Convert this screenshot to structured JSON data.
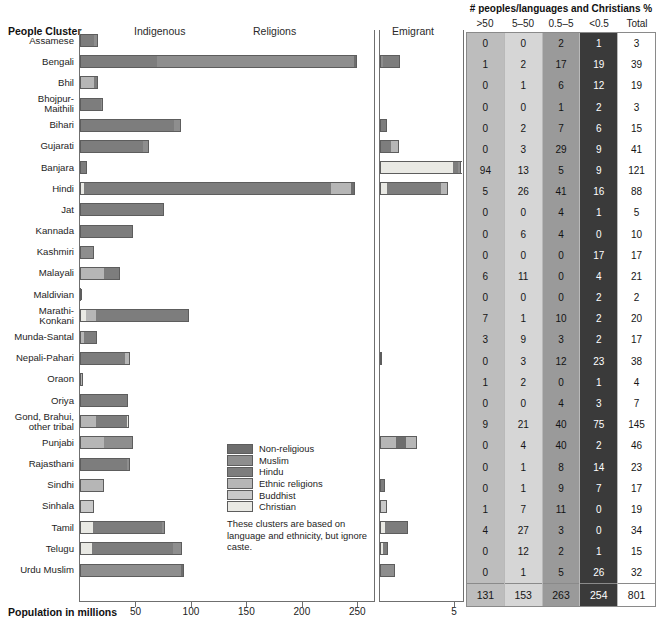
{
  "headers": {
    "people_cluster": "People Cluster",
    "indigenous": "Indigenous",
    "religions": "Religions",
    "emigrant": "Emigrant",
    "table_title": "# peoples/languages and Christians %",
    "axis_title": "Population in millions"
  },
  "table_columns": [
    ">50",
    "5–50",
    "0.5–5",
    "<0.5",
    "Total"
  ],
  "axis": {
    "main_ticks": [
      "50",
      "100",
      "150",
      "200",
      "250"
    ],
    "main_tick_values": [
      50,
      100,
      150,
      200,
      250
    ],
    "main_max": 265,
    "emigrant_ticks": [
      "5"
    ],
    "emigrant_max": 5.6
  },
  "legend": {
    "items": [
      {
        "label": "Non-religious",
        "color": "#6e6e6e"
      },
      {
        "label": "Muslim",
        "color": "#8e8e8e"
      },
      {
        "label": "Hindu",
        "color": "#7d7d7d"
      },
      {
        "label": "Ethnic religions",
        "color": "#b6b6b6"
      },
      {
        "label": "Buddhist",
        "color": "#c9c9c9"
      },
      {
        "label": "Christian",
        "color": "#e9e9e4"
      }
    ],
    "note": "These clusters are based on language and ethnicity, but ignore caste."
  },
  "chart_data": {
    "type": "bar",
    "title": "People Cluster",
    "xlabel": "Population in millions",
    "ylabel": "",
    "orientation": "horizontal",
    "stacked": true,
    "xlim": [
      0,
      265
    ],
    "grid": false,
    "legend_position": "inside-center",
    "categories": [
      "Assamese",
      "Bengali",
      "Bhil",
      "Bhojpur-Maithili",
      "Bihari",
      "Gujarati",
      "Banjara",
      "Hindi",
      "Jat",
      "Kannada",
      "Kashmiri",
      "Malayali",
      "Maldivian",
      "Marathi-Konkani",
      "Munda-Santal",
      "Nepali-Pahari",
      "Oraon",
      "Oriya",
      "Gond, Brahui, other tribal",
      "Punjabi",
      "Rajasthani",
      "Sindhi",
      "Sinhala",
      "Tamil",
      "Telugu",
      "Urdu Muslim"
    ],
    "series_names": [
      "Non-religious",
      "Muslim",
      "Hindu",
      "Ethnic religions",
      "Buddhist",
      "Christian"
    ],
    "population_stacks": [
      {
        "category": "Assamese",
        "total": 16,
        "segments": [
          {
            "name": "Hindu",
            "value": 13
          },
          {
            "name": "Muslim",
            "value": 3
          }
        ]
      },
      {
        "category": "Bengali",
        "total": 250,
        "segments": [
          {
            "name": "Hindu",
            "value": 69
          },
          {
            "name": "Muslim",
            "value": 178
          },
          {
            "name": "Non-religious",
            "value": 3
          }
        ]
      },
      {
        "category": "Bhil",
        "total": 16,
        "segments": [
          {
            "name": "Ethnic religions",
            "value": 13
          },
          {
            "name": "Hindu",
            "value": 3
          }
        ]
      },
      {
        "category": "Bhojpur-Maithili",
        "total": 21,
        "segments": [
          {
            "name": "Hindu",
            "value": 19
          },
          {
            "name": "Muslim",
            "value": 2
          }
        ]
      },
      {
        "category": "Bihari",
        "total": 91,
        "segments": [
          {
            "name": "Hindu",
            "value": 85
          },
          {
            "name": "Muslim",
            "value": 6
          }
        ]
      },
      {
        "category": "Gujarati",
        "total": 62,
        "segments": [
          {
            "name": "Hindu",
            "value": 57
          },
          {
            "name": "Muslim",
            "value": 5
          }
        ]
      },
      {
        "category": "Banjara",
        "total": 6,
        "segments": [
          {
            "name": "Hindu",
            "value": 6
          }
        ]
      },
      {
        "category": "Hindi",
        "total": 248,
        "segments": [
          {
            "name": "Christian",
            "value": 4
          },
          {
            "name": "Hindu",
            "value": 222
          },
          {
            "name": "Ethnic religions",
            "value": 18
          },
          {
            "name": "Non-religious",
            "value": 4
          }
        ]
      },
      {
        "category": "Jat",
        "total": 76,
        "segments": [
          {
            "name": "Hindu",
            "value": 76
          }
        ]
      },
      {
        "category": "Kannada",
        "total": 48,
        "segments": [
          {
            "name": "Hindu",
            "value": 48
          }
        ]
      },
      {
        "category": "Kashmiri",
        "total": 13,
        "segments": [
          {
            "name": "Muslim",
            "value": 13
          }
        ]
      },
      {
        "category": "Malayali",
        "total": 36,
        "segments": [
          {
            "name": "Ethnic religions",
            "value": 22
          },
          {
            "name": "Hindu",
            "value": 14
          }
        ]
      },
      {
        "category": "Maldivian",
        "total": 1,
        "segments": [
          {
            "name": "Muslim",
            "value": 1
          }
        ]
      },
      {
        "category": "Marathi-Konkani",
        "total": 98,
        "segments": [
          {
            "name": "Christian",
            "value": 5
          },
          {
            "name": "Ethnic religions",
            "value": 9
          },
          {
            "name": "Hindu",
            "value": 84
          }
        ]
      },
      {
        "category": "Munda-Santal",
        "total": 15,
        "segments": [
          {
            "name": "Ethnic religions",
            "value": 4
          },
          {
            "name": "Hindu",
            "value": 11
          }
        ]
      },
      {
        "category": "Nepali-Pahari",
        "total": 45,
        "segments": [
          {
            "name": "Hindu",
            "value": 41
          },
          {
            "name": "Ethnic religions",
            "value": 4
          }
        ]
      },
      {
        "category": "Oraon",
        "total": 3,
        "segments": [
          {
            "name": "Ethnic religions",
            "value": 3
          }
        ]
      },
      {
        "category": "Oriya",
        "total": 43,
        "segments": [
          {
            "name": "Hindu",
            "value": 43
          }
        ]
      },
      {
        "category": "Gond, Brahui, other tribal",
        "total": 44,
        "segments": [
          {
            "name": "Ethnic religions",
            "value": 14
          },
          {
            "name": "Hindu",
            "value": 28
          },
          {
            "name": "Christian",
            "value": 2
          }
        ]
      },
      {
        "category": "Punjabi",
        "total": 48,
        "segments": [
          {
            "name": "Ethnic religions",
            "value": 22
          },
          {
            "name": "Muslim",
            "value": 26
          }
        ]
      },
      {
        "category": "Rajasthani",
        "total": 45,
        "segments": [
          {
            "name": "Hindu",
            "value": 42
          },
          {
            "name": "Muslim",
            "value": 3
          }
        ]
      },
      {
        "category": "Sindhi",
        "total": 22,
        "segments": [
          {
            "name": "Ethnic religions",
            "value": 22
          }
        ]
      },
      {
        "category": "Sinhala",
        "total": 13,
        "segments": [
          {
            "name": "Buddhist",
            "value": 13
          }
        ]
      },
      {
        "category": "Tamil",
        "total": 77,
        "segments": [
          {
            "name": "Christian",
            "value": 12
          },
          {
            "name": "Hindu",
            "value": 62
          },
          {
            "name": "Muslim",
            "value": 3
          }
        ]
      },
      {
        "category": "Telugu",
        "total": 92,
        "segments": [
          {
            "name": "Christian",
            "value": 11
          },
          {
            "name": "Hindu",
            "value": 73
          },
          {
            "name": "Muslim",
            "value": 8
          }
        ]
      },
      {
        "category": "Urdu Muslim",
        "total": 94,
        "segments": [
          {
            "name": "Muslim",
            "value": 91
          },
          {
            "name": "Non-religious",
            "value": 3
          }
        ]
      }
    ],
    "emigrant_stacks": [
      {
        "category": "Assamese",
        "total": 0,
        "segments": []
      },
      {
        "category": "Bengali",
        "total": 1.35,
        "segments": [
          {
            "name": "Muslim",
            "value": 0.2
          },
          {
            "name": "Hindu",
            "value": 1.15
          }
        ]
      },
      {
        "category": "Bhil",
        "total": 0,
        "segments": []
      },
      {
        "category": "Bhojpur-Maithili",
        "total": 0,
        "segments": []
      },
      {
        "category": "Bihari",
        "total": 0.45,
        "segments": [
          {
            "name": "Hindu",
            "value": 0.45
          }
        ]
      },
      {
        "category": "Gujarati",
        "total": 1.3,
        "segments": [
          {
            "name": "Hindu",
            "value": 0.75
          },
          {
            "name": "Ethnic religions",
            "value": 0.55
          }
        ]
      },
      {
        "category": "Banjara",
        "total": 5.5,
        "segments": [
          {
            "name": "Christian",
            "value": 4.9
          },
          {
            "name": "Hindu",
            "value": 0.35
          },
          {
            "name": "Muslim",
            "value": 0.25
          }
        ]
      },
      {
        "category": "Hindi",
        "total": 4.6,
        "segments": [
          {
            "name": "Christian",
            "value": 0.5
          },
          {
            "name": "Hindu",
            "value": 3.6
          },
          {
            "name": "Ethnic religions",
            "value": 0.5
          }
        ]
      },
      {
        "category": "Jat",
        "total": 0,
        "segments": []
      },
      {
        "category": "Kannada",
        "total": 0,
        "segments": []
      },
      {
        "category": "Kashmiri",
        "total": 0,
        "segments": []
      },
      {
        "category": "Malayali",
        "total": 0,
        "segments": []
      },
      {
        "category": "Maldivian",
        "total": 0,
        "segments": []
      },
      {
        "category": "Marathi-Konkani",
        "total": 0,
        "segments": []
      },
      {
        "category": "Munda-Santal",
        "total": 0,
        "segments": []
      },
      {
        "category": "Nepali-Pahari",
        "total": 0.12,
        "segments": [
          {
            "name": "Hindu",
            "value": 0.12
          }
        ]
      },
      {
        "category": "Oraon",
        "total": 0,
        "segments": []
      },
      {
        "category": "Oriya",
        "total": 0,
        "segments": []
      },
      {
        "category": "Gond, Brahui, other tribal",
        "total": 0,
        "segments": []
      },
      {
        "category": "Punjabi",
        "total": 2.5,
        "segments": [
          {
            "name": "Ethnic religions",
            "value": 1.1
          },
          {
            "name": "Non-religious",
            "value": 0.65
          },
          {
            "name": "Ethnic religions",
            "value": 0.75
          }
        ]
      },
      {
        "category": "Rajasthani",
        "total": 0,
        "segments": []
      },
      {
        "category": "Sindhi",
        "total": 0.35,
        "segments": [
          {
            "name": "Hindu",
            "value": 0.35
          }
        ]
      },
      {
        "category": "Sinhala",
        "total": 0.45,
        "segments": [
          {
            "name": "Buddhist",
            "value": 0.45
          }
        ]
      },
      {
        "category": "Tamil",
        "total": 1.9,
        "segments": [
          {
            "name": "Christian",
            "value": 0.35
          },
          {
            "name": "Hindu",
            "value": 1.55
          }
        ]
      },
      {
        "category": "Telugu",
        "total": 0.55,
        "segments": [
          {
            "name": "Christian",
            "value": 0.18
          },
          {
            "name": "Hindu",
            "value": 0.37
          }
        ]
      },
      {
        "category": "Urdu Muslim",
        "total": 1.0,
        "segments": [
          {
            "name": "Muslim",
            "value": 1.0
          }
        ]
      }
    ]
  },
  "table": {
    "rows": [
      {
        "label": "Assamese",
        "values": [
          "0",
          "0",
          "2",
          "1",
          "3"
        ]
      },
      {
        "label": "Bengali",
        "values": [
          "1",
          "2",
          "17",
          "19",
          "39"
        ]
      },
      {
        "label": "Bhil",
        "values": [
          "0",
          "1",
          "6",
          "12",
          "19"
        ]
      },
      {
        "label": "Bhojpur-Maithili",
        "values": [
          "0",
          "0",
          "1",
          "2",
          "3"
        ]
      },
      {
        "label": "Bihari",
        "values": [
          "0",
          "2",
          "7",
          "6",
          "15"
        ]
      },
      {
        "label": "Gujarati",
        "values": [
          "0",
          "3",
          "29",
          "9",
          "41"
        ]
      },
      {
        "label": "Banjara",
        "values": [
          "94",
          "13",
          "5",
          "9",
          "121"
        ]
      },
      {
        "label": "Hindi",
        "values": [
          "5",
          "26",
          "41",
          "16",
          "88"
        ]
      },
      {
        "label": "Jat",
        "values": [
          "0",
          "0",
          "4",
          "1",
          "5"
        ]
      },
      {
        "label": "Kannada",
        "values": [
          "0",
          "6",
          "4",
          "0",
          "10"
        ]
      },
      {
        "label": "Kashmiri",
        "values": [
          "0",
          "0",
          "0",
          "17",
          "17"
        ]
      },
      {
        "label": "Malayali",
        "values": [
          "6",
          "11",
          "0",
          "4",
          "21"
        ]
      },
      {
        "label": "Maldivian",
        "values": [
          "0",
          "0",
          "0",
          "2",
          "2"
        ]
      },
      {
        "label": "Marathi-Konkani",
        "values": [
          "7",
          "1",
          "10",
          "2",
          "20"
        ]
      },
      {
        "label": "Munda-Santal",
        "values": [
          "3",
          "9",
          "3",
          "2",
          "17"
        ]
      },
      {
        "label": "Nepali-Pahari",
        "values": [
          "0",
          "3",
          "12",
          "23",
          "38"
        ]
      },
      {
        "label": "Oraon",
        "values": [
          "1",
          "2",
          "0",
          "1",
          "4"
        ]
      },
      {
        "label": "Oriya",
        "values": [
          "0",
          "0",
          "4",
          "3",
          "7"
        ]
      },
      {
        "label": "Gond, Brahui, other tribal",
        "values": [
          "9",
          "21",
          "40",
          "75",
          "145"
        ]
      },
      {
        "label": "Punjabi",
        "values": [
          "0",
          "4",
          "40",
          "2",
          "46"
        ]
      },
      {
        "label": "Rajasthani",
        "values": [
          "0",
          "1",
          "8",
          "14",
          "23"
        ]
      },
      {
        "label": "Sindhi",
        "values": [
          "0",
          "1",
          "9",
          "7",
          "17"
        ]
      },
      {
        "label": "Sinhala",
        "values": [
          "1",
          "7",
          "11",
          "0",
          "19"
        ]
      },
      {
        "label": "Tamil",
        "values": [
          "4",
          "27",
          "3",
          "0",
          "34"
        ]
      },
      {
        "label": "Telugu",
        "values": [
          "0",
          "12",
          "2",
          "1",
          "15"
        ]
      },
      {
        "label": "Urdu Muslim",
        "values": [
          "0",
          "1",
          "5",
          "26",
          "32"
        ]
      }
    ],
    "totals": [
      "131",
      "153",
      "263",
      "254",
      "801"
    ]
  }
}
